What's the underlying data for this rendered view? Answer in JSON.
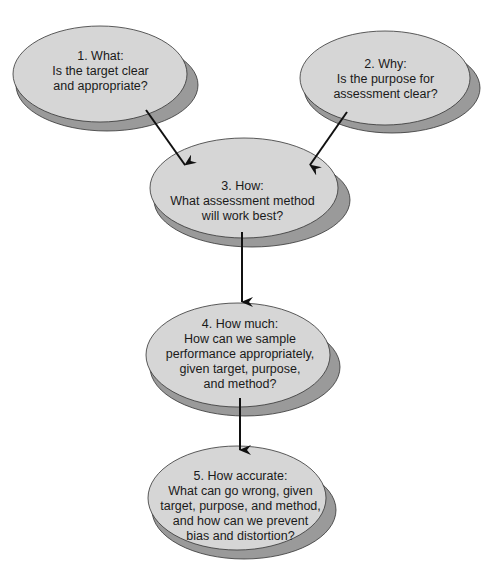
{
  "colors": {
    "ellipse_fill": "#d6d6d6",
    "shadow_fill": "#9a9a9a",
    "outline": "#333333",
    "arrow": "#111111",
    "background": "#ffffff"
  },
  "nodes": [
    {
      "id": "what",
      "lines": [
        "1.  What:",
        "Is the target clear",
        "and appropriate?"
      ]
    },
    {
      "id": "why",
      "lines": [
        "2.  Why:",
        "Is the purpose for",
        "assessment clear?"
      ]
    },
    {
      "id": "how",
      "lines": [
        "3.  How:",
        "What assessment method",
        "will work best?"
      ]
    },
    {
      "id": "how-much",
      "lines": [
        "4.  How much:",
        "How can we sample",
        "performance appropriately,",
        "given target, purpose,",
        "and method?"
      ]
    },
    {
      "id": "how-accurate",
      "lines": [
        "5.  How accurate:",
        "What can go wrong, given",
        "target, purpose, and method,",
        "and how can we prevent",
        "bias and distortion?"
      ]
    }
  ],
  "edges": [
    {
      "from": "what",
      "to": "how"
    },
    {
      "from": "why",
      "to": "how"
    },
    {
      "from": "how",
      "to": "how-much"
    },
    {
      "from": "how-much",
      "to": "how-accurate"
    }
  ]
}
